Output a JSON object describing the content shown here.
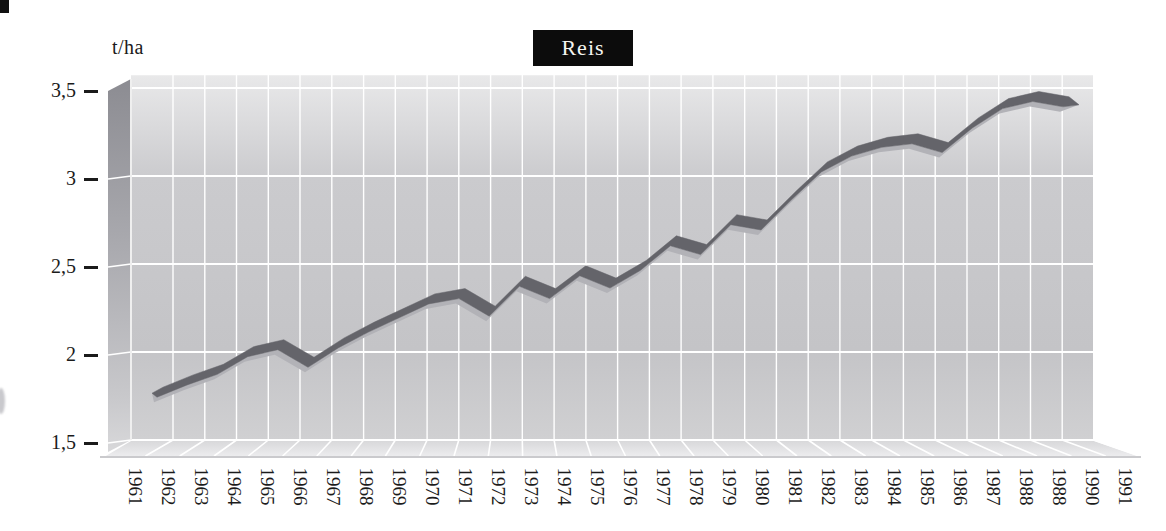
{
  "page": {
    "background": "#ffffff",
    "scan_artifacts": [
      "top-left-black-corner-mark",
      "left-edge-gray-smudge"
    ]
  },
  "chart_data": {
    "type": "line",
    "style": "3d-ribbon",
    "title": "Reis",
    "ylabel": "t/ha",
    "xlabel": "",
    "grid": true,
    "legend": "none",
    "ylim": [
      1.5,
      3.5
    ],
    "categories": [
      "1961",
      "1962",
      "1963",
      "1964",
      "1965",
      "1966",
      "1967",
      "1968",
      "1969",
      "1970",
      "1971",
      "1972",
      "1973",
      "1974",
      "1975",
      "1976",
      "1977",
      "1978",
      "1979",
      "1980",
      "1981",
      "1982",
      "1983",
      "1984",
      "1985",
      "1986",
      "1987",
      "1988",
      "1988",
      "1990",
      "1991"
    ],
    "misprint_note": "second '1988' label is printed in place of 1989 in the source chart",
    "values": [
      1.8,
      1.87,
      1.93,
      2.03,
      2.07,
      1.97,
      2.08,
      2.17,
      2.25,
      2.33,
      2.36,
      2.26,
      2.43,
      2.36,
      2.49,
      2.42,
      2.52,
      2.66,
      2.61,
      2.78,
      2.75,
      2.92,
      3.08,
      3.17,
      3.22,
      3.24,
      3.19,
      3.33,
      3.44,
      3.48,
      3.45
    ],
    "y_ticks": [
      {
        "value": 1.5,
        "label": "1,5"
      },
      {
        "value": 2.0,
        "label": "2"
      },
      {
        "value": 2.5,
        "label": "2,5"
      },
      {
        "value": 3.0,
        "label": "3"
      },
      {
        "value": 3.5,
        "label": "3,5"
      }
    ],
    "colors": {
      "ribbon_top": "#64646a",
      "ribbon_underside": "#b2b2b7",
      "wall_light": "#e9e9ea",
      "wall_mid": "#cbcbce",
      "wall_dark": "#c4c4c7",
      "side_wall_dark": "#8c8c92",
      "side_wall_light": "#d8d8da",
      "floor_light": "#ececee",
      "floor_mid": "#d7d7d9",
      "gridline": "#ffffff",
      "title_bg": "#0c0c0c",
      "title_fg": "#f5f5f1",
      "text": "#1b1b1b"
    }
  }
}
